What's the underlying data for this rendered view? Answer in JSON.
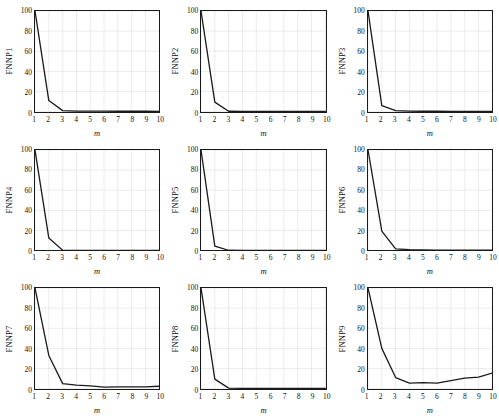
{
  "figure": {
    "layout": "3x3 grid of line plots",
    "rows": 3,
    "cols": 3,
    "background_color": "#ffffff",
    "line_color": "#1a1a1a",
    "grid_color": "#c8c8c8",
    "axis_color": "#1a1a1a"
  },
  "axis_common": {
    "xlabel": "m",
    "xticks": [
      1,
      2,
      3,
      4,
      5,
      6,
      7,
      8,
      9,
      10
    ],
    "yticks": [
      0,
      20,
      40,
      60,
      80,
      100
    ],
    "xlim": [
      1,
      10
    ],
    "ylim": [
      0,
      100
    ],
    "grid": true
  },
  "chart_data": [
    {
      "type": "line",
      "title": "",
      "ylabel": "FNNP1",
      "xlabel": "m",
      "x": [
        1,
        2,
        3,
        4,
        5,
        6,
        7,
        8,
        9,
        10
      ],
      "values": [
        100,
        11,
        1,
        0.6,
        0.5,
        0.5,
        0.4,
        0.4,
        0.4,
        0.3
      ],
      "xlim": [
        1,
        10
      ],
      "ylim": [
        0,
        100
      ],
      "xticks": [
        1,
        2,
        3,
        4,
        5,
        6,
        7,
        8,
        9,
        10
      ],
      "yticks": [
        0,
        20,
        40,
        60,
        80,
        100
      ],
      "grid": true,
      "legend": "none"
    },
    {
      "type": "line",
      "title": "",
      "ylabel": "FNNP2",
      "xlabel": "m",
      "x": [
        1,
        2,
        3,
        4,
        5,
        6,
        7,
        8,
        9,
        10
      ],
      "values": [
        100,
        9.5,
        0.4,
        0.2,
        0.2,
        0.2,
        0.2,
        0.2,
        0.2,
        0.2
      ],
      "xlim": [
        1,
        10
      ],
      "ylim": [
        0,
        100
      ],
      "xticks": [
        1,
        2,
        3,
        4,
        5,
        6,
        7,
        8,
        9,
        10
      ],
      "yticks": [
        0,
        20,
        40,
        60,
        80,
        100
      ],
      "grid": true,
      "legend": "none"
    },
    {
      "type": "line",
      "title": "",
      "ylabel": "FNNP3",
      "xlabel": "m",
      "x": [
        1,
        2,
        3,
        4,
        5,
        6,
        7,
        8,
        9,
        10
      ],
      "values": [
        100,
        6,
        1,
        0.5,
        0.4,
        0.4,
        0.3,
        0.3,
        0.3,
        0.3
      ],
      "xlim": [
        1,
        10
      ],
      "ylim": [
        0,
        100
      ],
      "xticks": [
        1,
        2,
        3,
        4,
        5,
        6,
        7,
        8,
        9,
        10
      ],
      "yticks": [
        0,
        20,
        40,
        60,
        80,
        100
      ],
      "grid": true,
      "legend": "none"
    },
    {
      "type": "line",
      "title": "",
      "ylabel": "FNNP4",
      "xlabel": "m",
      "x": [
        1,
        2,
        3,
        4,
        5,
        6,
        7,
        8,
        9,
        10
      ],
      "values": [
        100,
        12.5,
        0.5,
        0.3,
        0.3,
        0.2,
        0.2,
        0.2,
        0.2,
        0.2
      ],
      "xlim": [
        1,
        10
      ],
      "ylim": [
        0,
        100
      ],
      "xticks": [
        1,
        2,
        3,
        4,
        5,
        6,
        7,
        8,
        9,
        10
      ],
      "yticks": [
        0,
        20,
        40,
        60,
        80,
        100
      ],
      "grid": true,
      "legend": "none"
    },
    {
      "type": "line",
      "title": "",
      "ylabel": "FNNP5",
      "xlabel": "m",
      "x": [
        1,
        2,
        3,
        4,
        5,
        6,
        7,
        8,
        9,
        10
      ],
      "values": [
        100,
        4.5,
        0.4,
        0.3,
        0.2,
        0.2,
        0.2,
        0.2,
        0.2,
        0.2
      ],
      "xlim": [
        1,
        10
      ],
      "ylim": [
        0,
        100
      ],
      "xticks": [
        1,
        2,
        3,
        4,
        5,
        6,
        7,
        8,
        9,
        10
      ],
      "yticks": [
        0,
        20,
        40,
        60,
        80,
        100
      ],
      "grid": true,
      "legend": "none"
    },
    {
      "type": "line",
      "title": "",
      "ylabel": "FNNP6",
      "xlabel": "m",
      "x": [
        1,
        2,
        3,
        4,
        5,
        6,
        7,
        8,
        9,
        10
      ],
      "values": [
        100,
        19.5,
        1.8,
        1.0,
        0.7,
        0.5,
        0.5,
        0.4,
        0.4,
        0.4
      ],
      "xlim": [
        1,
        10
      ],
      "ylim": [
        0,
        100
      ],
      "xticks": [
        1,
        2,
        3,
        4,
        5,
        6,
        7,
        8,
        9,
        10
      ],
      "yticks": [
        0,
        20,
        40,
        60,
        80,
        100
      ],
      "grid": true,
      "legend": "none"
    },
    {
      "type": "line",
      "title": "",
      "ylabel": "FNNP7",
      "xlabel": "m",
      "x": [
        1,
        2,
        3,
        4,
        5,
        6,
        7,
        8,
        9,
        10
      ],
      "values": [
        100,
        33,
        5,
        3.5,
        2.8,
        1.6,
        1.7,
        1.7,
        1.7,
        2.4
      ],
      "xlim": [
        1,
        10
      ],
      "ylim": [
        0,
        100
      ],
      "xticks": [
        1,
        2,
        3,
        4,
        5,
        6,
        7,
        8,
        9,
        10
      ],
      "yticks": [
        0,
        20,
        40,
        60,
        80,
        100
      ],
      "grid": true,
      "legend": "none"
    },
    {
      "type": "line",
      "title": "",
      "ylabel": "FNNP8",
      "xlabel": "m",
      "x": [
        1,
        2,
        3,
        4,
        5,
        6,
        7,
        8,
        9,
        10
      ],
      "values": [
        100,
        9.5,
        0.5,
        0.3,
        0.3,
        0.3,
        0.3,
        0.2,
        0.2,
        0.2
      ],
      "xlim": [
        1,
        10
      ],
      "ylim": [
        0,
        100
      ],
      "xticks": [
        1,
        2,
        3,
        4,
        5,
        6,
        7,
        8,
        9,
        10
      ],
      "yticks": [
        0,
        20,
        40,
        60,
        80,
        100
      ],
      "grid": true,
      "legend": "none"
    },
    {
      "type": "line",
      "title": "",
      "ylabel": "FNNP9",
      "xlabel": "m",
      "x": [
        1,
        2,
        3,
        4,
        5,
        6,
        7,
        8,
        9,
        10
      ],
      "values": [
        100,
        40,
        11,
        5.5,
        6,
        5.5,
        8,
        10.5,
        11.5,
        15.5
      ],
      "xlim": [
        1,
        10
      ],
      "ylim": [
        0,
        100
      ],
      "xticks": [
        1,
        2,
        3,
        4,
        5,
        6,
        7,
        8,
        9,
        10
      ],
      "yticks": [
        0,
        20,
        40,
        60,
        80,
        100
      ],
      "grid": true,
      "legend": "none"
    }
  ]
}
